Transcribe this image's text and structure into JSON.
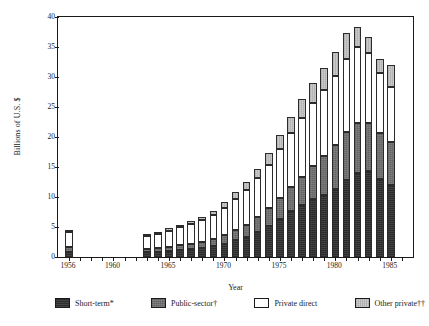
{
  "chart_data": {
    "type": "bar",
    "subtype": "stacked-vertical",
    "title": "",
    "xlabel": "Year",
    "ylabel": "Billions of U.S. $",
    "ylim": [
      0,
      40
    ],
    "ytick_step": 5,
    "yticks": [
      "0",
      "5",
      "10",
      "15",
      "20",
      "25",
      "30",
      "35",
      "40"
    ],
    "xlim": [
      1955,
      1987
    ],
    "xticks_labeled": [
      "1956",
      "1960",
      "1965",
      "1970",
      "1975",
      "1980",
      "1985"
    ],
    "xtick_every": 1,
    "grid": false,
    "legend_position": "below",
    "series": [
      {
        "name": "Short-term*",
        "color": "#2e2e2e",
        "values": [
          0.9,
          null,
          null,
          null,
          null,
          null,
          null,
          0.8,
          0.9,
          1.0,
          1.2,
          1.3,
          1.5,
          1.8,
          2.2,
          2.8,
          3.4,
          4.2,
          5.2,
          6.4,
          7.6,
          8.6,
          9.6,
          10.4,
          11.4,
          12.8,
          14.0,
          14.4,
          13.0,
          12.0
        ]
      },
      {
        "name": "Public-sector†",
        "color": "#6f6f6f",
        "values": [
          0.7,
          null,
          null,
          null,
          null,
          null,
          null,
          0.5,
          0.6,
          0.7,
          0.8,
          0.9,
          1.0,
          1.2,
          1.4,
          1.7,
          2.0,
          2.4,
          2.9,
          3.4,
          4.0,
          4.8,
          5.6,
          6.4,
          7.2,
          8.0,
          8.4,
          8.0,
          7.6,
          7.2
        ]
      },
      {
        "name": "Private direct",
        "color": "#ffffff",
        "values": [
          2.6,
          null,
          null,
          null,
          null,
          null,
          null,
          2.2,
          2.4,
          2.7,
          3.0,
          3.3,
          3.6,
          4.0,
          4.6,
          5.2,
          5.8,
          6.5,
          7.3,
          8.2,
          9.0,
          9.8,
          10.4,
          11.0,
          11.6,
          12.2,
          12.6,
          11.6,
          10.0,
          9.2
        ]
      },
      {
        "name": "Other private††",
        "color": "#c4c4c4",
        "values": [
          0.2,
          null,
          null,
          null,
          null,
          null,
          null,
          0.3,
          0.3,
          0.4,
          0.4,
          0.5,
          0.6,
          0.7,
          0.9,
          1.1,
          1.3,
          1.6,
          1.9,
          2.3,
          2.7,
          3.1,
          3.4,
          3.7,
          4.0,
          4.4,
          3.4,
          2.6,
          2.4,
          3.6
        ]
      }
    ],
    "categories": [
      1956,
      1957,
      1958,
      1959,
      1960,
      1961,
      1962,
      1963,
      1964,
      1965,
      1966,
      1967,
      1968,
      1969,
      1970,
      1971,
      1972,
      1973,
      1974,
      1975,
      1976,
      1977,
      1978,
      1979,
      1980,
      1981,
      1982,
      1983,
      1984,
      1985
    ],
    "totals": [
      4.4,
      null,
      null,
      null,
      null,
      null,
      null,
      3.8,
      4.2,
      4.8,
      5.4,
      6.0,
      6.7,
      7.7,
      9.1,
      10.8,
      12.5,
      14.7,
      17.3,
      20.3,
      23.3,
      26.3,
      29.0,
      31.5,
      34.2,
      37.4,
      38.4,
      36.6,
      33.0,
      32.0
    ]
  },
  "legend": {
    "items": [
      {
        "label": "Short-term*",
        "swatch": "s0"
      },
      {
        "label": "Public-sector†",
        "swatch": "s1"
      },
      {
        "label": "Private direct",
        "swatch": "s2"
      },
      {
        "label": "Other private††",
        "swatch": "s3"
      }
    ]
  }
}
